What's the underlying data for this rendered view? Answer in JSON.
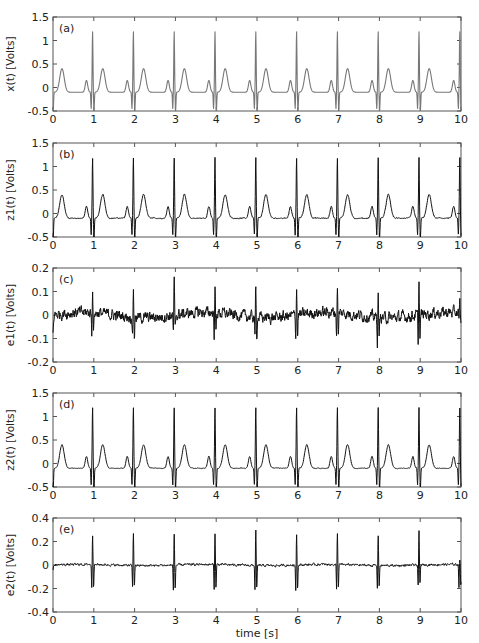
{
  "figure": {
    "xlabel": "time [s]",
    "x_ticks": [
      "0",
      "1",
      "2",
      "3",
      "4",
      "5",
      "6",
      "7",
      "8",
      "9",
      "10"
    ],
    "x_range": [
      0,
      10
    ],
    "layout": {
      "left": 53,
      "right": 461,
      "panel_height": 94,
      "tops": [
        17,
        143,
        268,
        393,
        518
      ]
    }
  },
  "chart_data": [
    {
      "type": "line",
      "panel": "(a)",
      "title": "",
      "xlabel": "",
      "ylabel": "x(t) [Volts]",
      "ylim": [
        -0.5,
        1.5
      ],
      "y_ticks": [
        "-0.5",
        "0",
        "0.5",
        "1",
        "1.5"
      ],
      "y_tick_values": [
        -0.5,
        0,
        0.5,
        1,
        1.5
      ],
      "line_color": "#777777",
      "description": "Clean synthetic ECG, ~1 beat per second; R peaks ~1.2 V at t≈1,2,...,9; T waves ~0.4 V; P waves ~0.25 V; baseline ~-0.1 V",
      "r_peak_times": [
        0.97,
        1.97,
        2.97,
        3.97,
        4.97,
        5.97,
        6.97,
        7.97,
        8.97,
        9.97
      ],
      "r_amplitude": 1.2,
      "s_amplitude": -0.4,
      "t_amplitude": 0.4,
      "p_amplitude": 0.25,
      "baseline": -0.1,
      "noise": 0.0,
      "grid": false
    },
    {
      "type": "line",
      "panel": "(b)",
      "ylabel": "z1(t) [Volts]",
      "ylim": [
        -0.5,
        1.5
      ],
      "y_ticks": [
        "-0.5",
        "0",
        "0.5",
        "1",
        "1.5"
      ],
      "y_tick_values": [
        -0.5,
        0,
        0.5,
        1,
        1.5
      ],
      "line_color": "#111111",
      "description": "Noisy ECG measurement z1(t), same morphology as x(t) with small additive noise",
      "r_peak_times": [
        0.97,
        1.97,
        2.97,
        3.97,
        4.97,
        5.97,
        6.97,
        7.97,
        8.97,
        9.97
      ],
      "r_amplitude": 1.2,
      "s_amplitude": -0.45,
      "t_amplitude": 0.4,
      "p_amplitude": 0.25,
      "baseline": -0.1,
      "noise": 0.012,
      "grid": false
    },
    {
      "type": "line",
      "panel": "(c)",
      "ylabel": "e1(t) [Volts]",
      "ylim": [
        -0.2,
        0.2
      ],
      "y_ticks": [
        "-0.2",
        "-0.1",
        "0",
        "0.1",
        "0.2"
      ],
      "y_tick_values": [
        -0.2,
        -0.1,
        0,
        0.1,
        0.2
      ],
      "line_color": "#111111",
      "description": "Error signal e1(t): broadband noise ~±0.04 V with spikes up to ~0.15 / -0.1 V at each R peak",
      "r_peak_times": [
        0.97,
        1.97,
        2.97,
        3.97,
        4.97,
        5.97,
        6.97,
        7.97,
        8.97,
        9.97
      ],
      "spike_pos": [
        0.1,
        0.12,
        0.15,
        0.11,
        0.14,
        0.12,
        0.12,
        0.1,
        0.14,
        0.05
      ],
      "spike_neg": [
        -0.09,
        -0.09,
        -0.08,
        -0.1,
        -0.1,
        -0.1,
        -0.11,
        -0.11,
        -0.12,
        -0.05
      ],
      "noise": 0.028,
      "grid": false
    },
    {
      "type": "line",
      "panel": "(d)",
      "ylabel": "z2(t) [Volts]",
      "ylim": [
        -0.5,
        1.5
      ],
      "y_ticks": [
        "-0.5",
        "0",
        "0.5",
        "1",
        "1.5"
      ],
      "y_tick_values": [
        -0.5,
        0,
        0.5,
        1,
        1.5
      ],
      "line_color": "#111111",
      "description": "Second noisy ECG measurement z2(t)",
      "r_peak_times": [
        0.97,
        1.97,
        2.97,
        3.97,
        4.97,
        5.97,
        6.97,
        7.97,
        8.97,
        9.97
      ],
      "r_amplitude": 1.2,
      "s_amplitude": -0.45,
      "t_amplitude": 0.4,
      "p_amplitude": 0.25,
      "baseline": -0.1,
      "noise": 0.008,
      "grid": false
    },
    {
      "type": "line",
      "panel": "(e)",
      "ylabel": "e2(t) [Volts]",
      "ylim": [
        -0.4,
        0.4
      ],
      "y_ticks": [
        "-0.4",
        "-0.2",
        "0",
        "0.2",
        "0.4"
      ],
      "y_tick_values": [
        -0.4,
        -0.2,
        0,
        0.2,
        0.4
      ],
      "line_color": "#111111",
      "description": "Error signal e2(t): low noise ~±0.02 V with biphasic spikes ~+0.27 / -0.2 V at each R peak",
      "r_peak_times": [
        0.97,
        1.97,
        2.97,
        3.97,
        4.97,
        5.97,
        6.97,
        7.97,
        8.97,
        9.97
      ],
      "spike_pos": [
        0.26,
        0.28,
        0.27,
        0.27,
        0.3,
        0.27,
        0.27,
        0.27,
        0.29,
        0.05
      ],
      "spike_neg": [
        -0.21,
        -0.19,
        -0.23,
        -0.22,
        -0.22,
        -0.22,
        -0.22,
        -0.2,
        -0.19,
        -0.2
      ],
      "noise": 0.012,
      "grid": false
    }
  ]
}
